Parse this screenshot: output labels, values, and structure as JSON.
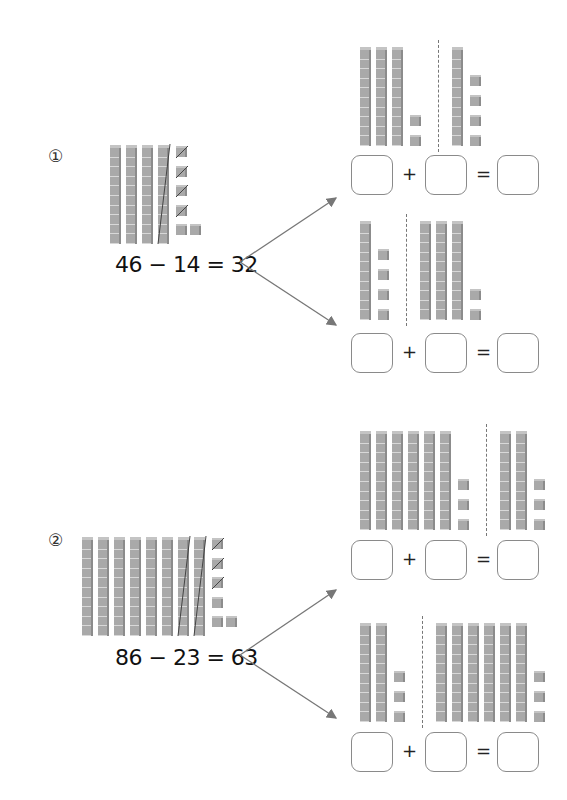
{
  "problems": [
    {
      "number": "①",
      "equation": "46 − 14 = 32",
      "blocks": {
        "tens": 4,
        "ones": 6,
        "crossed_tens": 1,
        "crossed_ones": 4
      },
      "branches": [
        {
          "left": {
            "tens": 3,
            "ones": 2
          },
          "right": {
            "tens": 1,
            "ones": 4
          },
          "boxes": [
            "",
            "",
            ""
          ],
          "plus": "+",
          "equals": "="
        },
        {
          "left": {
            "tens": 1,
            "ones": 4
          },
          "right": {
            "tens": 3,
            "ones": 2
          },
          "boxes": [
            "",
            "",
            ""
          ],
          "plus": "+",
          "equals": "="
        }
      ]
    },
    {
      "number": "②",
      "equation": "86 − 23 = 63",
      "blocks": {
        "tens": 8,
        "ones": 6,
        "crossed_tens": 2,
        "crossed_ones": 3
      },
      "branches": [
        {
          "left": {
            "tens": 6,
            "ones": 3
          },
          "right": {
            "tens": 2,
            "ones": 3
          },
          "boxes": [
            "",
            "",
            ""
          ],
          "plus": "+",
          "equals": "="
        },
        {
          "left": {
            "tens": 2,
            "ones": 3
          },
          "right": {
            "tens": 6,
            "ones": 3
          },
          "boxes": [
            "",
            "",
            ""
          ],
          "plus": "+",
          "equals": "="
        }
      ]
    }
  ],
  "colors": {
    "block": "#a9a9a9",
    "box_border": "#8a8a8a",
    "arrow": "#777777"
  }
}
